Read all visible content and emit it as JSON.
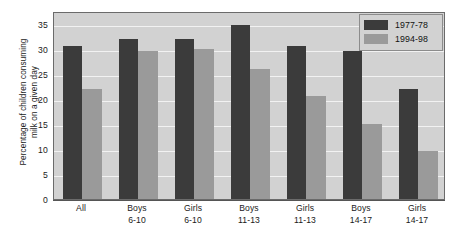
{
  "chart_data": {
    "type": "bar",
    "title": "",
    "xlabel": "",
    "ylabel_lines": [
      "Percentage of children consuming",
      "milk on a given day"
    ],
    "ylabel": "Percentage of children consuming milk on a given day",
    "categories": [
      "All",
      "Boys 6-10",
      "Girls 6-10",
      "Boys 11-13",
      "Girls 11-13",
      "Boys 14-17",
      "Girls 14-17"
    ],
    "category_lines": [
      [
        "All"
      ],
      [
        "Boys",
        "6-10"
      ],
      [
        "Girls",
        "6-10"
      ],
      [
        "Boys",
        "11-13"
      ],
      [
        "Girls",
        "11-13"
      ],
      [
        "Boys",
        "14-17"
      ],
      [
        "Girls",
        "14-17"
      ]
    ],
    "series": [
      {
        "name": "1977-78",
        "color": "#3b3b3b",
        "values": [
          30.5,
          32.0,
          32.0,
          34.8,
          30.5,
          29.5,
          22.0
        ]
      },
      {
        "name": "1994-98",
        "color": "#9a9a9a",
        "values": [
          22.0,
          29.5,
          30.0,
          26.0,
          20.5,
          15.0,
          9.5
        ]
      }
    ],
    "ylim": [
      0,
      37.5
    ],
    "yticks": [
      0,
      5,
      10,
      15,
      20,
      25,
      30,
      35
    ],
    "ytick_labels": [
      "0",
      "5",
      "10",
      "15",
      "20",
      "25",
      "30",
      "35"
    ],
    "grid": true,
    "grid_color": "#f2f2f2",
    "plot_background": "#d2d2d2",
    "legend_position": "top-right"
  },
  "legend": {
    "entries": [
      {
        "label": "1977-78"
      },
      {
        "label": "1994-98"
      }
    ]
  }
}
